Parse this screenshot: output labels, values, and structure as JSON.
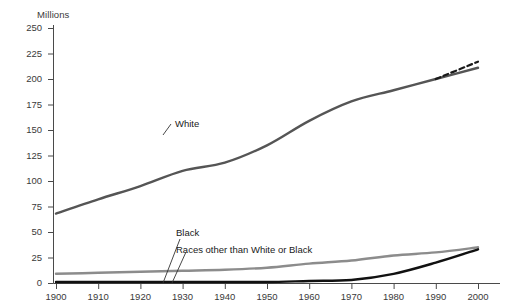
{
  "chart_data": {
    "type": "line",
    "title": "",
    "subtitle": "",
    "xlabel": "",
    "ylabel": "Millions",
    "ylim": [
      0,
      250
    ],
    "xlim": [
      1900,
      2000
    ],
    "grid": false,
    "legend_position": "inline-annotations",
    "yticks": [
      0,
      25,
      50,
      75,
      100,
      125,
      150,
      175,
      200,
      225,
      250
    ],
    "xticks": [
      1900,
      1910,
      1920,
      1930,
      1940,
      1950,
      1960,
      1970,
      1980,
      1990,
      2000
    ],
    "x": [
      1900,
      1910,
      1920,
      1930,
      1940,
      1950,
      1960,
      1970,
      1980,
      1990,
      2000
    ],
    "series": [
      {
        "name": "White",
        "color": "#555555",
        "style": "solid",
        "values": [
          68,
          82,
          95,
          110,
          118,
          135,
          159,
          178,
          189,
          200,
          211
        ]
      },
      {
        "name": "White (projected)",
        "color": "#1a1a1a",
        "style": "dashed",
        "x": [
          1990,
          2000
        ],
        "values": [
          200,
          217
        ]
      },
      {
        "name": "Black",
        "color": "#8c8c8c",
        "style": "solid",
        "values": [
          9,
          10,
          11,
          12,
          13,
          15,
          19,
          22,
          27,
          30,
          35
        ]
      },
      {
        "name": "Races other than White or Black",
        "color": "#111111",
        "style": "solid",
        "values": [
          1,
          1,
          1,
          1,
          1,
          1,
          2,
          3,
          9,
          20,
          33
        ]
      }
    ],
    "annotations": [
      {
        "text": "White",
        "x": 1930,
        "y": 125
      },
      {
        "text": "Black",
        "x": 1926,
        "y": 44
      },
      {
        "text": "Races other than White or Black",
        "x": 1926,
        "y": 30
      }
    ]
  },
  "axis": {
    "y_unit_label": "Millions",
    "ytick_labels": [
      "250",
      "225",
      "200",
      "175",
      "150",
      "125",
      "100",
      "75",
      "50",
      "25",
      "0"
    ],
    "xtick_labels": [
      "1900",
      "1910",
      "1920",
      "1930",
      "1940",
      "1950",
      "1960",
      "1970",
      "1980",
      "1990",
      "2000"
    ]
  },
  "labels": {
    "white": "White",
    "black": "Black",
    "other": "Races other than White or Black"
  }
}
